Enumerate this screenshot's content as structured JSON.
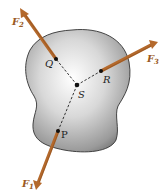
{
  "diagram": {
    "colors": {
      "arrow": "#b4692c",
      "arrow_dark": "#7a4318",
      "label": "#9a5a22",
      "point_label": "#222222",
      "body_edge": "#3a3a3a",
      "body_light": "#f4f4f4",
      "body_dark": "#8c8c8c"
    },
    "points": [
      {
        "id": "Q",
        "label": "Q",
        "x": 56,
        "y": 59
      },
      {
        "id": "R",
        "label": "R",
        "x": 101,
        "y": 71
      },
      {
        "id": "S",
        "label": "S",
        "x": 77,
        "y": 85
      },
      {
        "id": "P",
        "label": "P",
        "x": 58,
        "y": 131
      }
    ],
    "forces": [
      {
        "id": "F1",
        "label": "F",
        "subscript": "1",
        "from": "P",
        "tip": [
          36,
          190
        ]
      },
      {
        "id": "F2",
        "label": "F",
        "subscript": "2",
        "from": "Q",
        "tip": [
          20,
          8
        ]
      },
      {
        "id": "F3",
        "label": "F",
        "subscript": "3",
        "from": "R",
        "tip": [
          158,
          42
        ]
      }
    ]
  }
}
